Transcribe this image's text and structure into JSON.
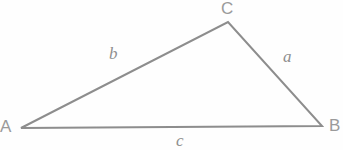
{
  "figure": {
    "type": "geometry-diagram",
    "background_color": "#fefefe",
    "stroke_color": "#8d8d8d",
    "label_color": "#9a9a9a",
    "stroke_width": 2
  },
  "vertices": [
    {
      "id": "A",
      "label": "A",
      "x": 21,
      "y": 128
    },
    {
      "id": "B",
      "label": "B",
      "x": 322,
      "y": 126
    },
    {
      "id": "C",
      "label": "C",
      "x": 228,
      "y": 22
    }
  ],
  "sides": [
    {
      "id": "a",
      "label": "a",
      "from": "C",
      "to": "B",
      "label_x": 288,
      "label_y": 56
    },
    {
      "id": "b",
      "label": "b",
      "from": "A",
      "to": "C",
      "label_x": 114,
      "label_y": 54
    },
    {
      "id": "c",
      "label": "c",
      "from": "A",
      "to": "B",
      "label_x": 181,
      "label_y": 139
    }
  ],
  "geometry": {
    "path": "M 21 128 L 228 22 L 322 126 Z"
  }
}
